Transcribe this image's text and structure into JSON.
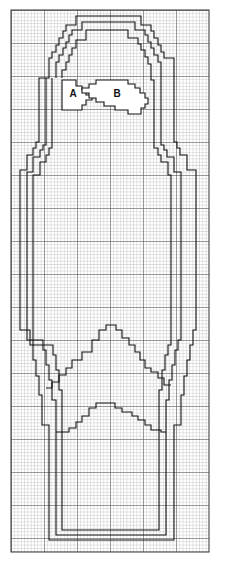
{
  "diagram": {
    "type": "knitting-chart",
    "grid": {
      "x0": 11,
      "y0": 10,
      "x1": 209,
      "y1": 552,
      "cell": 3.3,
      "major_every": 10,
      "minor_color": "#9a9a9a",
      "major_color": "#333333",
      "outline_color": "#111111"
    },
    "labels": [
      {
        "id": "A",
        "text": "A",
        "x": 73,
        "y": 96
      },
      {
        "id": "B",
        "text": "B",
        "x": 117,
        "y": 96
      }
    ]
  }
}
